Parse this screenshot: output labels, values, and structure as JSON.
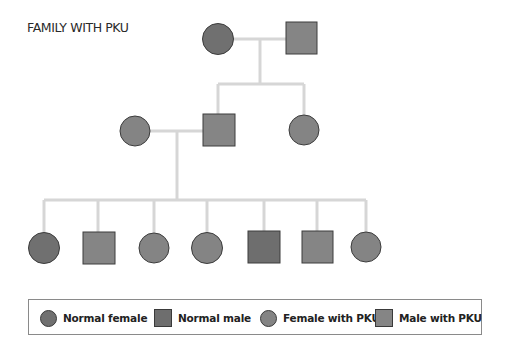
{
  "title": "FAMILY WITH PKU",
  "colors": {
    "line": "#d6d6d6",
    "stroke": "#3c3c3c",
    "normal_female": "#707070",
    "normal_male": "#6e6e6e",
    "female_with_pku": "#848484",
    "male_with_pku": "#858585"
  },
  "pedigree": {
    "generation_1": [
      {
        "id": "grandmother",
        "sex": "female",
        "status": "Normal female"
      },
      {
        "id": "grandfather",
        "sex": "male",
        "status": "Male with PKU"
      }
    ],
    "generation_2": [
      {
        "id": "mother",
        "sex": "female",
        "status": "Female with PKU",
        "married_in": true
      },
      {
        "id": "father",
        "sex": "male",
        "status": "Male with PKU"
      },
      {
        "id": "aunt",
        "sex": "female",
        "status": "Female with PKU"
      }
    ],
    "generation_3": [
      {
        "id": "child-1",
        "sex": "female",
        "status": "Normal female"
      },
      {
        "id": "child-2",
        "sex": "male",
        "status": "Male with PKU"
      },
      {
        "id": "child-3",
        "sex": "female",
        "status": "Female with PKU"
      },
      {
        "id": "child-4",
        "sex": "female",
        "status": "Female with PKU"
      },
      {
        "id": "child-5",
        "sex": "male",
        "status": "Normal male"
      },
      {
        "id": "child-6",
        "sex": "male",
        "status": "Male with PKU"
      },
      {
        "id": "child-7",
        "sex": "female",
        "status": "Female with PKU"
      }
    ]
  },
  "legend": {
    "items": [
      {
        "label": "Normal female",
        "shape": "circle",
        "color": "#707070"
      },
      {
        "label": "Normal male",
        "shape": "square",
        "color": "#6e6e6e"
      },
      {
        "label": "Female with PKU",
        "shape": "circle",
        "color": "#848484"
      },
      {
        "label": "Male with PKU",
        "shape": "square",
        "color": "#858585"
      }
    ]
  }
}
